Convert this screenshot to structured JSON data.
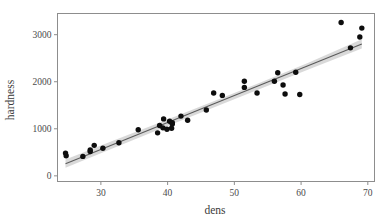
{
  "chart_data": {
    "type": "scatter",
    "title": "",
    "subtitle": "",
    "xlabel": "dens",
    "ylabel": "hardness",
    "xlim": [
      23.5,
      71.0
    ],
    "ylim": [
      -120,
      3450
    ],
    "xticks": [
      30,
      40,
      50,
      60,
      70
    ],
    "yticks": [
      0,
      1000,
      2000,
      3000
    ],
    "xticklabels": [
      "30",
      "40",
      "50",
      "60",
      "70"
    ],
    "yticklabels": [
      "0",
      "1000",
      "2000",
      "3000"
    ],
    "grid": false,
    "legend": null,
    "annotations": [],
    "series": [
      {
        "name": "observations",
        "type": "scatter",
        "marker": "filled-circle",
        "color": "#0d0d0d",
        "x": [
          24.7,
          24.8,
          27.3,
          28.4,
          28.4,
          29.0,
          30.3,
          32.7,
          35.6,
          38.5,
          38.8,
          39.3,
          39.4,
          39.9,
          40.3,
          40.6,
          40.7,
          40.7,
          42.0,
          43.0,
          45.8,
          46.9,
          48.2,
          51.5,
          51.5,
          53.4,
          56.0,
          56.5,
          57.3,
          57.6,
          59.2,
          59.8,
          66.0,
          67.4,
          68.8,
          69.1
        ],
        "y": [
          484,
          427,
          413,
          517,
          549,
          648,
          587,
          704,
          979,
          914,
          1070,
          1020,
          1210,
          989,
          1160,
          1010,
          1100,
          1130,
          1270,
          1180,
          1400,
          1760,
          1710,
          2010,
          1880,
          1760,
          2010,
          2190,
          1930,
          1740,
          2200,
          1730,
          3260,
          2720,
          2950,
          3140
        ]
      }
    ],
    "fit": {
      "name": "linear-regression",
      "type": "line",
      "color": "#5b5b5b",
      "x": [
        24.7,
        69.1
      ],
      "y": [
        259,
        2803
      ],
      "band": {
        "name": "confidence-band",
        "color": "#b9b9b9",
        "x": [
          24.7,
          32.0,
          40.0,
          47.0,
          54.0,
          61.0,
          69.1
        ],
        "lower": [
          170,
          598,
          1059,
          1459,
          1857,
          2253,
          2705
        ],
        "upper": [
          348,
          758,
          1199,
          1589,
          1991,
          2399,
          2901
        ]
      }
    }
  },
  "axes": {
    "x_title": "dens",
    "y_title": "hardness"
  }
}
